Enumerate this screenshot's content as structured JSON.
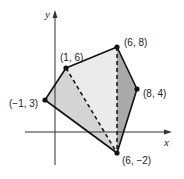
{
  "diagram": {
    "type": "coordinate-plane-polygon",
    "axes": {
      "x_label": "x",
      "y_label": "y"
    },
    "vertices": [
      {
        "id": "A",
        "label": "(1, 6)",
        "x": 1,
        "y": 6
      },
      {
        "id": "B",
        "label": "(6, 8)",
        "x": 6,
        "y": 8
      },
      {
        "id": "C",
        "label": "(8, 4)",
        "x": 8,
        "y": 4
      },
      {
        "id": "D",
        "label": "(6, −2)",
        "x": 6,
        "y": -2
      },
      {
        "id": "E",
        "label": "(−1, 3)",
        "x": -1,
        "y": 3
      }
    ],
    "polygon_order": [
      "E",
      "A",
      "B",
      "C",
      "D"
    ],
    "diagonals": [
      {
        "from": "A",
        "to": "D",
        "style": "dashed"
      },
      {
        "from": "B",
        "to": "D",
        "style": "dashed"
      }
    ],
    "regions": [
      {
        "name": "triangle-EAD",
        "vertices": [
          "E",
          "A",
          "D"
        ],
        "fill": "#d4d4d4"
      },
      {
        "name": "triangle-ABD",
        "vertices": [
          "A",
          "B",
          "D"
        ],
        "fill": "#ebebeb"
      },
      {
        "name": "triangle-BCD",
        "vertices": [
          "B",
          "C",
          "D"
        ],
        "fill": "#a9a9a9"
      }
    ],
    "colors": {
      "outline": "#111111",
      "axis": "#333333"
    }
  }
}
